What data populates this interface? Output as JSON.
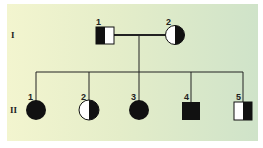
{
  "generations": [
    {
      "label": "I",
      "individuals": [
        {
          "number": "1",
          "sex": "male",
          "phenotype": "heterozygous carrier (half-shaded, left dark)"
        },
        {
          "number": "2",
          "sex": "female",
          "phenotype": "heterozygous carrier (half-shaded, right dark)"
        }
      ]
    },
    {
      "label": "II",
      "individuals": [
        {
          "number": "1",
          "sex": "female",
          "phenotype": "affected"
        },
        {
          "number": "2",
          "sex": "female",
          "phenotype": "heterozygous carrier (half-shaded, right dark)"
        },
        {
          "number": "3",
          "sex": "female",
          "phenotype": "affected"
        },
        {
          "number": "4",
          "sex": "male",
          "phenotype": "affected"
        },
        {
          "number": "5",
          "sex": "male",
          "phenotype": "heterozygous carrier (half-shaded, right dark)"
        }
      ]
    }
  ],
  "colors": {
    "symbol_fill": "#111111",
    "symbol_empty": "#ffffff",
    "line": "#222222",
    "bg_left": "#f3f5cf",
    "bg_right": "#cfe3c9"
  }
}
